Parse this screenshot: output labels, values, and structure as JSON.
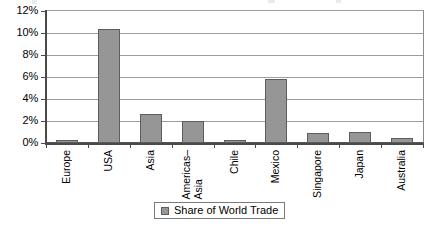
{
  "chart_data": {
    "type": "bar",
    "title": "",
    "subtitle": "",
    "xlabel": "",
    "ylabel": "",
    "categories": [
      "Europe",
      "USA",
      "Asia",
      "Americas–Asia",
      "Chile",
      "Mexico",
      "Singapore",
      "Japan",
      "Australia"
    ],
    "category_lines": [
      [
        "Europe"
      ],
      [
        "USA"
      ],
      [
        "Asia"
      ],
      [
        "Americas–",
        "Asia"
      ],
      [
        "Chile"
      ],
      [
        "Mexico"
      ],
      [
        "Singapore"
      ],
      [
        "Japan"
      ],
      [
        "Australia"
      ]
    ],
    "values": [
      0.3,
      10.4,
      2.6,
      2.0,
      0.3,
      5.8,
      0.9,
      1.0,
      0.5
    ],
    "value_labels": [
      "0.3%",
      "10.4%",
      "2.6%",
      "2.0%",
      "0.3%",
      "5.8%",
      "0.9%",
      "1.0%",
      "0.5%"
    ],
    "series": [
      {
        "name": "Share of World Trade",
        "values": [
          0.3,
          10.4,
          2.6,
          2.0,
          0.3,
          5.8,
          0.9,
          1.0,
          0.5
        ]
      }
    ],
    "ylim": [
      0,
      12
    ],
    "ytick_values": [
      0,
      2,
      4,
      6,
      8,
      10,
      12
    ],
    "ytick_labels": [
      "0%",
      "2%",
      "4%",
      "6%",
      "8%",
      "10%",
      "12%"
    ],
    "grid": true,
    "grid_axis": "y",
    "legend": {
      "position": "bottom",
      "entries": [
        {
          "label": "Share of World Trade",
          "color": "#969696"
        }
      ]
    },
    "colors": {
      "bar_fill": "#969696",
      "bar_border": "#5d5d5d",
      "gridline": "#9c9c9c",
      "axis": "#4a4a4a",
      "plot_background": "#ffffff",
      "text": "#000000"
    }
  }
}
